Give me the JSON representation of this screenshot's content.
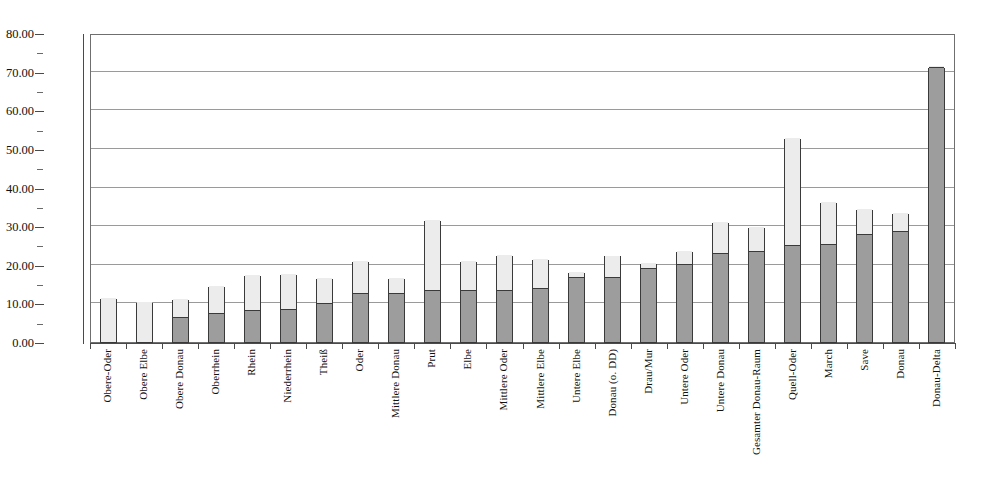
{
  "chart_data": {
    "type": "bar",
    "title": "",
    "xlabel": "",
    "ylabel": "",
    "ylim": [
      0,
      80
    ],
    "ytick_step": 10,
    "ytick_labels": [
      "80.00",
      "70.00",
      "60.00",
      "50.00",
      "40.00",
      "30.00",
      "20.00",
      "10.00",
      "0.00"
    ],
    "ytick_values": [
      80,
      70,
      60,
      50,
      40,
      30,
      20,
      10,
      0
    ],
    "grid": true,
    "stacked": true,
    "legend": "none",
    "colors": {
      "lower_segment": "#9d9d9d",
      "upper_segment": "#ececec",
      "bar_outline": "#3a3a3a",
      "gridline": "#9a9a9a",
      "axis": "#4a4a4a",
      "background": "#ffffff"
    },
    "categories": [
      "Obere-Oder",
      "Obere Elbe",
      "Obere Donau",
      "Oberrhein",
      "Rhein",
      "Niederrhein",
      "Theiß",
      "Oder",
      "Mittlere Donau",
      "Prut",
      "Elbe",
      "Mittlere Oder",
      "Mittlere Elbe",
      "Untere Elbe",
      "Donau (o. DD)",
      "Drau/Mur",
      "Untere Oder",
      "Untere Donau",
      "Gesamter Donau-Raum",
      "Quell-Oder",
      "March",
      "Save",
      "Donau",
      "Donau-Delta"
    ],
    "series": [
      {
        "name": "lower",
        "values": [
          0.0,
          0.0,
          6.3,
          7.2,
          8.0,
          8.3,
          9.8,
          12.4,
          12.4,
          13.1,
          13.3,
          13.2,
          13.7,
          16.6,
          16.6,
          18.8,
          20.0,
          22.8,
          23.3,
          24.8,
          25.2,
          27.7,
          28.5,
          71.0
        ]
      },
      {
        "name": "upper",
        "values": [
          11.5,
          10.3,
          4.8,
          7.3,
          9.3,
          9.3,
          6.8,
          8.6,
          4.2,
          18.6,
          7.7,
          9.3,
          7.8,
          1.6,
          5.8,
          1.6,
          3.5,
          8.4,
          6.5,
          28.0,
          11.0,
          6.7,
          4.8,
          0.3
        ]
      }
    ],
    "totals": [
      11.5,
      10.3,
      11.1,
      14.5,
      17.3,
      17.6,
      16.6,
      21.0,
      16.6,
      31.7,
      21.0,
      22.5,
      21.5,
      18.2,
      22.4,
      20.4,
      23.5,
      31.2,
      29.8,
      52.8,
      36.2,
      34.4,
      33.3,
      71.3
    ]
  }
}
